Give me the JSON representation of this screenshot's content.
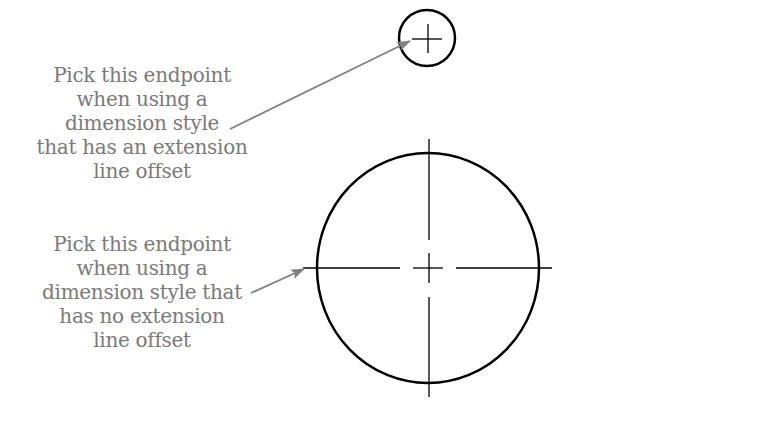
{
  "diagram": {
    "callouts": [
      {
        "lines": [
          "Pick this endpoint",
          "when using a",
          "dimension style",
          "that has an extension",
          "line offset"
        ],
        "arrow_target": "small-circle-left-quadrant"
      },
      {
        "lines": [
          "Pick this endpoint",
          "when using a",
          "dimension style that",
          "has no extension",
          "line offset"
        ],
        "arrow_target": "large-circle-centerline-endpoint"
      }
    ],
    "colors": {
      "text": "#7a7a7a",
      "arrow": "#808080",
      "geometry": "#000000",
      "background": "#ffffff"
    },
    "shapes": {
      "small_circle": {
        "cx": 427,
        "cy": 38,
        "r": 28,
        "center_mark": "plus"
      },
      "large_circle": {
        "cx": 428,
        "cy": 268,
        "rx": 111,
        "ry": 115,
        "centerlines": true
      }
    }
  }
}
